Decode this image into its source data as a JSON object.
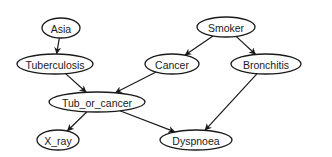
{
  "diagram": {
    "type": "bayesian-network",
    "colors": {
      "stroke": "#1a1a1a",
      "fill": "#ffffff",
      "text": "#1a1a1a"
    },
    "nodes": [
      {
        "id": "asia",
        "label": "Asia",
        "cx": 61,
        "cy": 28,
        "rx": 19,
        "ry": 10
      },
      {
        "id": "tuberculosis",
        "label": "Tuberculosis",
        "cx": 55,
        "cy": 64,
        "rx": 38,
        "ry": 10
      },
      {
        "id": "smoker",
        "label": "Smoker",
        "cx": 226,
        "cy": 27,
        "rx": 29,
        "ry": 10
      },
      {
        "id": "cancer",
        "label": "Cancer",
        "cx": 172,
        "cy": 64,
        "rx": 27,
        "ry": 10
      },
      {
        "id": "bronchitis",
        "label": "Bronchitis",
        "cx": 266,
        "cy": 64,
        "rx": 35,
        "ry": 10
      },
      {
        "id": "tub_or_cancer",
        "label": "Tub_or_cancer",
        "cx": 97,
        "cy": 102,
        "rx": 48,
        "ry": 10
      },
      {
        "id": "x_ray",
        "label": "X_ray",
        "cx": 58,
        "cy": 140,
        "rx": 21,
        "ry": 10
      },
      {
        "id": "dyspnoea",
        "label": "Dyspnoea",
        "cx": 196,
        "cy": 140,
        "rx": 36,
        "ry": 10
      }
    ],
    "edges": [
      {
        "from": "asia",
        "to": "tuberculosis"
      },
      {
        "from": "smoker",
        "to": "cancer"
      },
      {
        "from": "smoker",
        "to": "bronchitis"
      },
      {
        "from": "tuberculosis",
        "to": "tub_or_cancer"
      },
      {
        "from": "cancer",
        "to": "tub_or_cancer"
      },
      {
        "from": "tub_or_cancer",
        "to": "x_ray"
      },
      {
        "from": "tub_or_cancer",
        "to": "dyspnoea"
      },
      {
        "from": "bronchitis",
        "to": "dyspnoea"
      }
    ]
  }
}
